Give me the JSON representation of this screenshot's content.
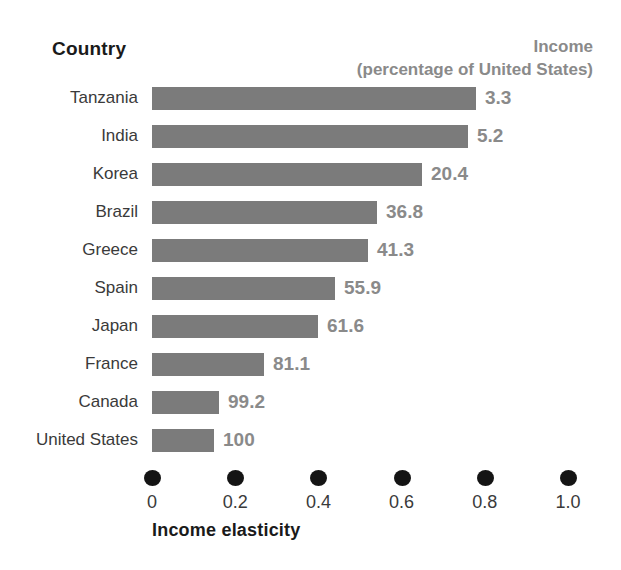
{
  "header": {
    "country_label": "Country",
    "income_label_line1": "Income",
    "income_label_line2": "(percentage of United States)"
  },
  "axis": {
    "title": "Income elasticity",
    "ticks": [
      "0",
      "0.2",
      "0.4",
      "0.6",
      "0.8",
      "1.0"
    ],
    "tick_values": [
      0,
      0.2,
      0.4,
      0.6,
      0.8,
      1.0
    ],
    "dot_marker": "filled-circle"
  },
  "colors": {
    "bar": "#7b7b7b",
    "value_text": "#8a8a8a",
    "label_text": "#3a3a3a",
    "header_text": "#1a1a1a",
    "axis_dot": "#141414",
    "background": "#ffffff"
  },
  "chart_data": {
    "type": "bar",
    "orientation": "horizontal",
    "title": "",
    "xlabel": "Income elasticity",
    "ylabel": "Country",
    "xlim": [
      0,
      1.0
    ],
    "grid": false,
    "legend": false,
    "categories": [
      "Tanzania",
      "India",
      "Korea",
      "Brazil",
      "Greece",
      "Spain",
      "Japan",
      "France",
      "Canada",
      "United States"
    ],
    "values": [
      0.78,
      0.76,
      0.65,
      0.54,
      0.52,
      0.44,
      0.4,
      0.27,
      0.16,
      0.15
    ],
    "data_labels": [
      "3.3",
      "5.2",
      "20.4",
      "36.8",
      "41.3",
      "55.9",
      "61.6",
      "81.1",
      "99.2",
      "100"
    ],
    "data_label_meaning": "Income (percentage of United States)",
    "rows": [
      {
        "country": "Tanzania",
        "elasticity": 0.78,
        "income_pct": "3.3"
      },
      {
        "country": "India",
        "elasticity": 0.76,
        "income_pct": "5.2"
      },
      {
        "country": "Korea",
        "elasticity": 0.65,
        "income_pct": "20.4"
      },
      {
        "country": "Brazil",
        "elasticity": 0.54,
        "income_pct": "36.8"
      },
      {
        "country": "Greece",
        "elasticity": 0.52,
        "income_pct": "41.3"
      },
      {
        "country": "Spain",
        "elasticity": 0.44,
        "income_pct": "55.9"
      },
      {
        "country": "Japan",
        "elasticity": 0.4,
        "income_pct": "61.6"
      },
      {
        "country": "France",
        "elasticity": 0.27,
        "income_pct": "81.1"
      },
      {
        "country": "Canada",
        "elasticity": 0.16,
        "income_pct": "99.2"
      },
      {
        "country": "United States",
        "elasticity": 0.15,
        "income_pct": "100"
      }
    ]
  }
}
